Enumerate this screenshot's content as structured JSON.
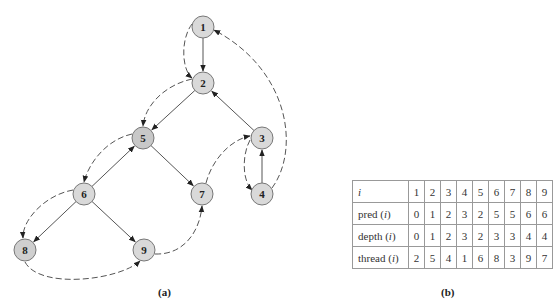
{
  "figure": {
    "caption_a": "(a)",
    "caption_b": "(b)"
  },
  "tree": {
    "nodes": [
      {
        "id": "1",
        "x": 203,
        "y": 27,
        "fill": "#d9d9d9"
      },
      {
        "id": "2",
        "x": 203,
        "y": 83,
        "fill": "#d9d9d9"
      },
      {
        "id": "3",
        "x": 262,
        "y": 138,
        "fill": "#d9d9d9"
      },
      {
        "id": "4",
        "x": 262,
        "y": 194,
        "fill": "#d9d9d9"
      },
      {
        "id": "5",
        "x": 143,
        "y": 138,
        "fill": "#c8c8c8"
      },
      {
        "id": "6",
        "x": 84,
        "y": 194,
        "fill": "#d9d9d9"
      },
      {
        "id": "7",
        "x": 202,
        "y": 194,
        "fill": "#d9d9d9"
      },
      {
        "id": "8",
        "x": 25,
        "y": 250,
        "fill": "#cfcfcf"
      },
      {
        "id": "9",
        "x": 144,
        "y": 250,
        "fill": "#d9d9d9"
      }
    ],
    "tree_edges": [
      {
        "from": "1",
        "to": "2"
      },
      {
        "from": "2",
        "to": "5"
      },
      {
        "from": "3",
        "to": "2"
      },
      {
        "from": "4",
        "to": "3"
      },
      {
        "from": "5",
        "to": "7"
      },
      {
        "from": "6",
        "to": "5"
      },
      {
        "from": "6",
        "to": "8"
      },
      {
        "from": "6",
        "to": "9"
      }
    ],
    "thread_edges": [
      {
        "from": "1",
        "to": "2"
      },
      {
        "from": "2",
        "to": "5"
      },
      {
        "from": "5",
        "to": "6"
      },
      {
        "from": "6",
        "to": "8"
      },
      {
        "from": "8",
        "to": "9"
      },
      {
        "from": "9",
        "to": "7"
      },
      {
        "from": "7",
        "to": "3"
      },
      {
        "from": "3",
        "to": "4"
      },
      {
        "from": "4",
        "to": "1"
      }
    ],
    "edge_color": "#555555"
  },
  "table": {
    "rows": [
      {
        "label": "i",
        "label_suffix": "",
        "italic_only": true,
        "values": [
          "1",
          "2",
          "3",
          "4",
          "5",
          "6",
          "7",
          "8",
          "9"
        ]
      },
      {
        "label": "pred (",
        "label_var": "i",
        "label_suffix": ")",
        "values": [
          "0",
          "1",
          "2",
          "3",
          "2",
          "5",
          "5",
          "6",
          "6"
        ]
      },
      {
        "label": "depth (",
        "label_var": "i",
        "label_suffix": ")",
        "values": [
          "0",
          "1",
          "2",
          "3",
          "2",
          "3",
          "3",
          "4",
          "4"
        ]
      },
      {
        "label": "thread (",
        "label_var": "i",
        "label_suffix": ")",
        "values": [
          "2",
          "5",
          "4",
          "1",
          "6",
          "8",
          "3",
          "9",
          "7"
        ]
      }
    ]
  }
}
